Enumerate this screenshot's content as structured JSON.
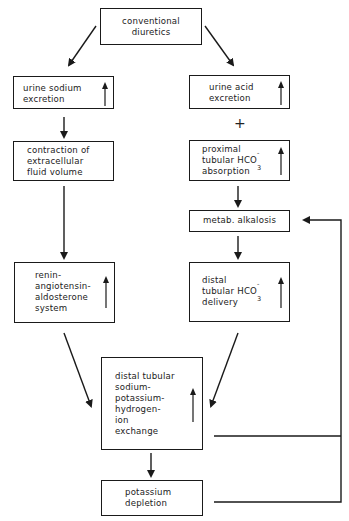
{
  "diagram": {
    "type": "flowchart",
    "nodes": {
      "conventional_diuretics": {
        "label": "conventional\ndiuretics"
      },
      "urine_sodium": {
        "label": "urine sodium\nexcretion",
        "indicator": "increase"
      },
      "urine_acid": {
        "label": "urine acid\nexcretion",
        "indicator": "increase"
      },
      "contraction": {
        "label": "contraction of\nextracellular\nfluid volume"
      },
      "proximal": {
        "line1": "proximal",
        "line2": "tubular HCO",
        "sub": "3",
        "sup": "-",
        "line3": "absorption",
        "indicator": "increase"
      },
      "metab_alkalosis": {
        "label": "metab. alkalosis"
      },
      "raas": {
        "label": "renin-\nangiotensin-\naldosterone\nsystem",
        "indicator": "increase"
      },
      "distal_delivery": {
        "line1": "distal",
        "line2": "tubular HCO",
        "sub": "3",
        "sup": "-",
        "line3": "delivery",
        "indicator": "increase"
      },
      "distal_exchange": {
        "label": "distal tubular\nsodium-\npotassium-\nhydrogen-\nion\nexchange",
        "indicator": "increase"
      },
      "potassium_depletion": {
        "label": "potassium\ndepletion"
      }
    },
    "connectors": {
      "plus_label": "+"
    },
    "edges": [
      [
        "conventional_diuretics",
        "urine_sodium"
      ],
      [
        "conventional_diuretics",
        "urine_acid"
      ],
      [
        "urine_sodium",
        "contraction"
      ],
      [
        "urine_acid",
        "proximal",
        "+"
      ],
      [
        "proximal",
        "metab_alkalosis"
      ],
      [
        "contraction",
        "raas"
      ],
      [
        "metab_alkalosis",
        "distal_delivery"
      ],
      [
        "raas",
        "distal_exchange"
      ],
      [
        "distal_delivery",
        "distal_exchange"
      ],
      [
        "distal_exchange",
        "potassium_depletion"
      ],
      [
        "distal_exchange",
        "metab_alkalosis",
        "feedback"
      ],
      [
        "potassium_depletion",
        "metab_alkalosis",
        "feedback"
      ]
    ]
  }
}
